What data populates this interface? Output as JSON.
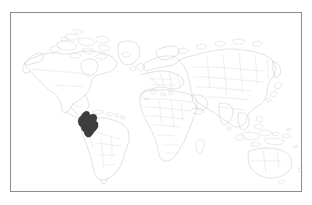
{
  "figure": {
    "kind": "world-map-locator",
    "width": 312,
    "height": 205,
    "background_color": "#ffffff",
    "frame": {
      "visible": true,
      "color": "#8c8c8c",
      "x": 10,
      "y": 12,
      "width": 292,
      "height": 180
    },
    "title": "",
    "caption": "",
    "labels": []
  },
  "map": {
    "projection": "equirectangular",
    "outline_color": "#c9c9c9",
    "border_color": "#d5d5d5",
    "ocean_color": "#ffffff",
    "graticule": false,
    "legend": false,
    "highlight": {
      "name": "Colombia",
      "region": "South America",
      "fill_color": "#3d3d3d",
      "stroke_color": "#2a2a2a",
      "label_visible": false
    },
    "continents": [
      "North America",
      "South America",
      "Europe",
      "Africa",
      "Asia",
      "Australia"
    ]
  },
  "chart_data": {
    "type": "map",
    "title": "",
    "xlabel": "",
    "ylabel": "",
    "categories": [
      "Colombia"
    ],
    "values": [
      1
    ],
    "highlighted": [
      "Colombia"
    ],
    "unhighlighted_fill": "#ffffff",
    "highlight_fill": "#3d3d3d",
    "annotations": []
  }
}
